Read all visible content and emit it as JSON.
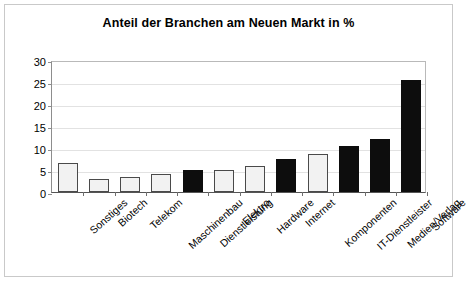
{
  "chart_data": {
    "type": "bar",
    "title": "Anteil der Branchen am Neuen Markt in %",
    "xlabel": "",
    "ylabel": "",
    "ylim": [
      0,
      30
    ],
    "yticks": [
      0,
      5,
      10,
      15,
      20,
      25,
      30
    ],
    "grid": true,
    "legend": "none",
    "categories": [
      "Sonstiges",
      "Biotech",
      "Telekom",
      "Maschinenbau",
      "Dienstleistung",
      "Elektro",
      "Hardware",
      "Internet",
      "Komponenten",
      "IT-Dienstleister",
      "Medien/Verlag",
      "Software"
    ],
    "values": [
      6.5,
      3.0,
      3.4,
      4.1,
      5.0,
      5.0,
      6.0,
      7.5,
      8.7,
      10.5,
      12.0,
      25.5
    ],
    "bar_styles": [
      "light",
      "light",
      "light",
      "light",
      "dark",
      "light",
      "light",
      "dark",
      "light",
      "dark",
      "dark",
      "dark"
    ],
    "colors": {
      "bar_light_fill": "#f2f2f2",
      "bar_light_border": "#4a4a4a",
      "bar_dark_fill": "#0d0d0d",
      "axis": "#555555",
      "grid": "#e2e2e2",
      "frame": "#c9c9c9",
      "text": "#000000"
    }
  }
}
